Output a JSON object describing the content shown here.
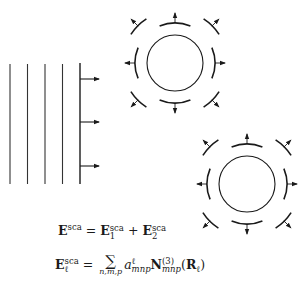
{
  "figure": {
    "type": "multiple-sphere scattering schematic",
    "incident_wave": {
      "wavefront_count": 5,
      "propagation_arrows": 3,
      "direction": "right"
    },
    "scatterers": [
      {
        "label": "sphere-1",
        "center": [
          175,
          63
        ],
        "inner_radius": 28,
        "outgoing_arcs": 8
      },
      {
        "label": "sphere-2",
        "center": [
          247,
          184
        ],
        "inner_radius": 28,
        "outgoing_arcs": 8
      }
    ],
    "colors": {
      "stroke": "#1a1a1a",
      "background": "#ffffff"
    }
  },
  "equations": {
    "eq1": {
      "lhs_symbol": "E",
      "lhs_sup": "sca",
      "equals": "=",
      "term1_symbol": "E",
      "term1_sub": "1",
      "term1_sup": "sca",
      "plus": "+",
      "term2_symbol": "E",
      "term2_sub": "2",
      "term2_sup": "sca"
    },
    "eq2": {
      "lhs_symbol": "E",
      "lhs_sub": "ℓ",
      "lhs_sup": "sca",
      "equals": "=",
      "sum_symbol": "∑",
      "sum_index": "n,m,p",
      "coef_symbol": "a",
      "coef_sup": "ℓ",
      "coef_sub": "mnp",
      "vec_symbol": "N",
      "vec_sup": "(3)",
      "vec_sub": "mnp",
      "arg_open": "(",
      "arg_symbol": "R",
      "arg_sub": "ℓ",
      "arg_close": ")"
    }
  }
}
